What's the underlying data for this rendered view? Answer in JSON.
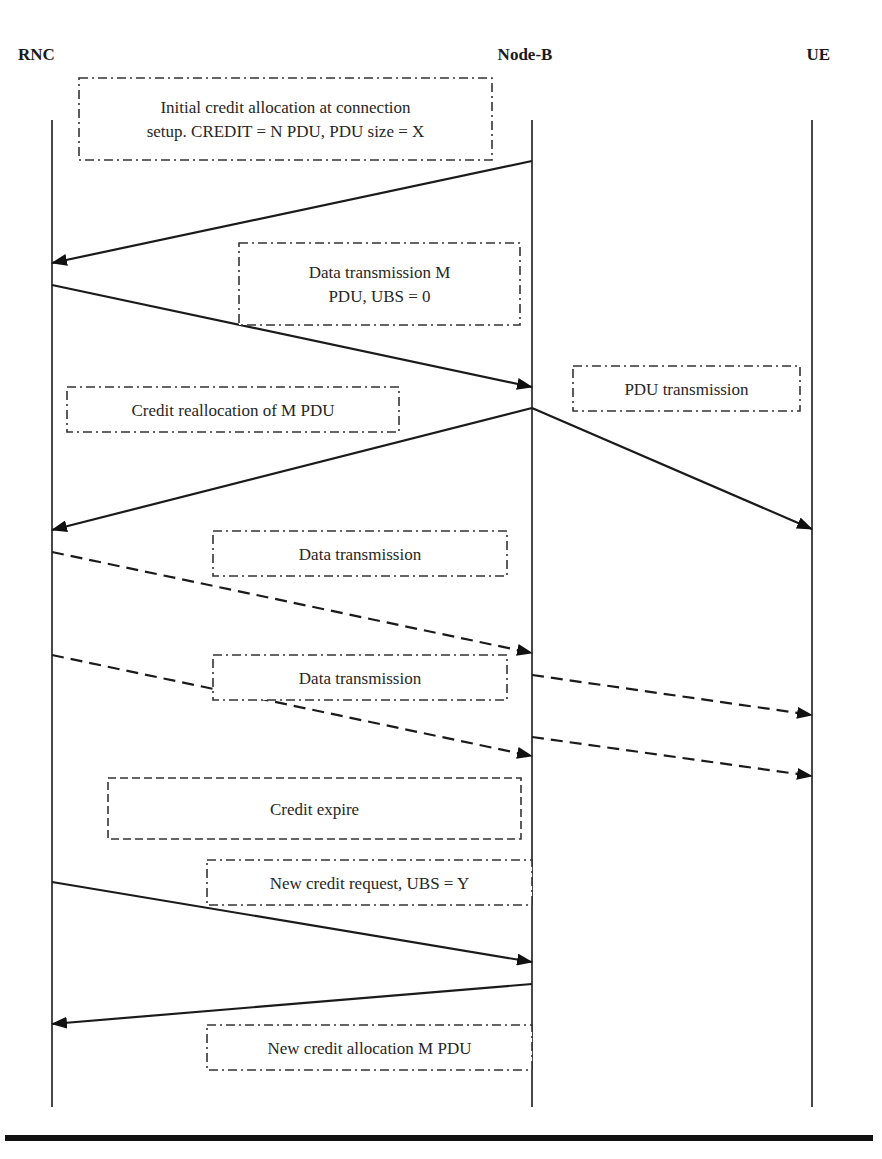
{
  "diagram": {
    "type": "sequence",
    "entities": [
      {
        "id": "rnc",
        "label": "RNC",
        "x": 52,
        "label_x": 18,
        "label_anchor": "start"
      },
      {
        "id": "nodeb",
        "label": "Node-B",
        "x": 532,
        "label_x": 525,
        "label_anchor": "middle"
      },
      {
        "id": "ue",
        "label": "UE",
        "x": 812,
        "label_x": 830,
        "label_anchor": "end"
      }
    ],
    "label_y": 60,
    "lifeline_top": 120,
    "lifeline_bottom": 1107,
    "notes": [
      {
        "id": "initial-credit-allocation",
        "x": 79,
        "y": 78,
        "w": 413,
        "h": 82,
        "style": "dashdot",
        "lines": [
          "Initial credit allocation at connection",
          "setup. CREDIT = N PDU, PDU size = X"
        ]
      },
      {
        "id": "data-transmission-m",
        "x": 239,
        "y": 243,
        "w": 281,
        "h": 82,
        "style": "dashdot",
        "lines": [
          "Data transmission M",
          "PDU, UBS = 0"
        ]
      },
      {
        "id": "pdu-transmission",
        "x": 573,
        "y": 366,
        "w": 227,
        "h": 45,
        "style": "dashdot",
        "lines": [
          "PDU transmission"
        ]
      },
      {
        "id": "credit-reallocation",
        "x": 67,
        "y": 387,
        "w": 332,
        "h": 45,
        "style": "dashdot",
        "lines": [
          "Credit reallocation of M PDU"
        ]
      },
      {
        "id": "data-transmission-1",
        "x": 213,
        "y": 531,
        "w": 294,
        "h": 45,
        "style": "dashdot",
        "lines": [
          "Data transmission"
        ]
      },
      {
        "id": "data-transmission-2",
        "x": 213,
        "y": 655,
        "w": 294,
        "h": 45,
        "style": "dashdot",
        "lines": [
          "Data transmission"
        ]
      },
      {
        "id": "credit-expire",
        "x": 108,
        "y": 778,
        "w": 413,
        "h": 61,
        "style": "dashed",
        "lines": [
          "Credit expire"
        ]
      },
      {
        "id": "new-credit-request",
        "x": 207,
        "y": 860,
        "w": 325,
        "h": 45,
        "style": "dashdot",
        "lines": [
          "New credit request, UBS = Y"
        ]
      },
      {
        "id": "new-credit-allocation",
        "x": 207,
        "y": 1025,
        "w": 325,
        "h": 45,
        "style": "dashdot",
        "lines": [
          "New credit allocation M PDU"
        ]
      }
    ],
    "messages": [
      {
        "id": "credit-allocation",
        "from": "nodeb",
        "to": "rnc",
        "y1": 161,
        "y2": 263,
        "style": "solid"
      },
      {
        "id": "data-transmission-m-pdu",
        "from": "rnc",
        "to": "nodeb",
        "y1": 285,
        "y2": 387,
        "style": "solid"
      },
      {
        "id": "credit-reallocation",
        "from": "nodeb",
        "to": "rnc",
        "y1": 408,
        "y2": 530,
        "style": "solid"
      },
      {
        "id": "pdu-transmission",
        "from": "nodeb",
        "to": "ue",
        "y1": 408,
        "y2": 529,
        "style": "solid"
      },
      {
        "id": "data-transmission-1",
        "from": "rnc",
        "to": "nodeb",
        "y1": 552,
        "y2": 653,
        "style": "dashed"
      },
      {
        "id": "data-transmission-2",
        "from": "rnc",
        "to": "nodeb",
        "y1": 655,
        "y2": 756,
        "style": "dashed"
      },
      {
        "id": "forward-1",
        "from": "nodeb",
        "to": "ue",
        "y1": 675,
        "y2": 715,
        "style": "dashed"
      },
      {
        "id": "forward-2",
        "from": "nodeb",
        "to": "ue",
        "y1": 737,
        "y2": 776,
        "style": "dashed"
      },
      {
        "id": "new-credit-request",
        "from": "rnc",
        "to": "nodeb",
        "y1": 882,
        "y2": 962,
        "style": "solid"
      },
      {
        "id": "new-credit-allocation",
        "from": "nodeb",
        "to": "rnc",
        "y1": 984,
        "y2": 1024,
        "style": "solid"
      }
    ],
    "bottom_rule": {
      "x": 5,
      "y": 1135,
      "w": 868,
      "h": 6
    }
  }
}
